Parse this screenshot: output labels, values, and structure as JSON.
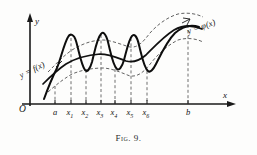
{
  "figure": {
    "caption_prefix": "Fig.",
    "caption_number": "9.",
    "caption_full": "Fig. 9."
  },
  "axes": {
    "y_axis_label": "y",
    "x_axis_label": "x",
    "origin_label": "O"
  },
  "curve_labels": {
    "f_label": "y = f(x)",
    "phi_label": "y = φ(x)"
  },
  "x_ticks": [
    {
      "label": "a",
      "sub": "",
      "px": 55
    },
    {
      "label": "x",
      "sub": "1",
      "px": 71
    },
    {
      "label": "x",
      "sub": "2",
      "px": 86
    },
    {
      "label": "x",
      "sub": "3",
      "px": 101
    },
    {
      "label": "x",
      "sub": "4",
      "px": 115
    },
    {
      "label": "x",
      "sub": "5",
      "px": 131
    },
    {
      "label": "x",
      "sub": "6",
      "px": 147
    },
    {
      "label": "b",
      "sub": "",
      "px": 188
    }
  ],
  "colors": {
    "ink": "#111111",
    "dashed": "#5a5a5a",
    "background": "#fdfdfc"
  },
  "chart_data": {
    "type": "line",
    "title": "Fig. 9.",
    "xlabel": "x",
    "ylabel": "y",
    "grid": false,
    "legend": "inline-annotations",
    "xlim": [
      0,
      210
    ],
    "ylim": [
      0,
      105
    ],
    "annotations": [
      {
        "text": "y = f(x)",
        "target": "oscillating-curve"
      },
      {
        "text": "y = φ(x)",
        "target": "smooth-curve"
      }
    ],
    "tick_labels": [
      "a",
      "x1",
      "x2",
      "x3",
      "x4",
      "x5",
      "x6",
      "b"
    ],
    "series": [
      {
        "name": "y = φ(x)",
        "style": "solid",
        "description": "smooth monotone-ish limit curve rising from a to b with a gentle dip near x5",
        "points": [
          [
            47,
            80
          ],
          [
            55,
            73
          ],
          [
            63,
            66
          ],
          [
            71,
            61
          ],
          [
            79,
            58
          ],
          [
            86,
            56
          ],
          [
            94,
            55
          ],
          [
            101,
            54
          ],
          [
            109,
            55
          ],
          [
            115,
            57
          ],
          [
            123,
            60
          ],
          [
            131,
            62
          ],
          [
            139,
            60
          ],
          [
            147,
            54
          ],
          [
            155,
            45
          ],
          [
            163,
            37
          ],
          [
            171,
            31
          ],
          [
            180,
            27
          ],
          [
            188,
            25
          ],
          [
            196,
            26
          ],
          [
            203,
            29
          ]
        ]
      },
      {
        "name": "y = f(x)",
        "style": "solid-oscillating",
        "description": "oscillating approximating curve with three tall spikes between a and x6, converging to phi near b",
        "points": [
          [
            45,
            95
          ],
          [
            50,
            84
          ],
          [
            55,
            74
          ],
          [
            60,
            63
          ],
          [
            64,
            50
          ],
          [
            67,
            40
          ],
          [
            71,
            36
          ],
          [
            75,
            42
          ],
          [
            79,
            56
          ],
          [
            83,
            66
          ],
          [
            86,
            70
          ],
          [
            90,
            62
          ],
          [
            94,
            48
          ],
          [
            98,
            38
          ],
          [
            101,
            34
          ],
          [
            105,
            38
          ],
          [
            109,
            50
          ],
          [
            113,
            62
          ],
          [
            117,
            68
          ],
          [
            121,
            62
          ],
          [
            125,
            48
          ],
          [
            129,
            39
          ],
          [
            131,
            37
          ],
          [
            135,
            42
          ],
          [
            139,
            56
          ],
          [
            143,
            67
          ],
          [
            147,
            71
          ],
          [
            151,
            68
          ],
          [
            155,
            58
          ],
          [
            160,
            47
          ],
          [
            166,
            38
          ],
          [
            172,
            32
          ],
          [
            179,
            28
          ],
          [
            186,
            25
          ],
          [
            193,
            25
          ],
          [
            200,
            28
          ]
        ]
      },
      {
        "name": "upper envelope",
        "style": "dashed",
        "description": "dashed upper bound of the epsilon-band around phi",
        "points": [
          [
            48,
            72
          ],
          [
            56,
            63
          ],
          [
            64,
            55
          ],
          [
            72,
            49
          ],
          [
            80,
            45
          ],
          [
            88,
            42
          ],
          [
            96,
            40
          ],
          [
            104,
            40
          ],
          [
            112,
            42
          ],
          [
            120,
            45
          ],
          [
            128,
            47
          ],
          [
            136,
            45
          ],
          [
            144,
            39
          ],
          [
            152,
            31
          ],
          [
            160,
            24
          ],
          [
            168,
            18
          ],
          [
            177,
            14
          ],
          [
            186,
            12
          ],
          [
            195,
            13
          ],
          [
            202,
            16
          ]
        ]
      },
      {
        "name": "lower envelope",
        "style": "dashed",
        "description": "dashed lower bound of the epsilon-band around phi",
        "points": [
          [
            48,
            92
          ],
          [
            56,
            85
          ],
          [
            64,
            79
          ],
          [
            72,
            74
          ],
          [
            80,
            71
          ],
          [
            88,
            69
          ],
          [
            96,
            68
          ],
          [
            104,
            68
          ],
          [
            112,
            70
          ],
          [
            120,
            73
          ],
          [
            128,
            76
          ],
          [
            136,
            75
          ],
          [
            144,
            70
          ],
          [
            152,
            61
          ],
          [
            160,
            51
          ],
          [
            168,
            44
          ],
          [
            177,
            39
          ],
          [
            186,
            37
          ],
          [
            195,
            38
          ],
          [
            202,
            41
          ]
        ]
      }
    ]
  }
}
